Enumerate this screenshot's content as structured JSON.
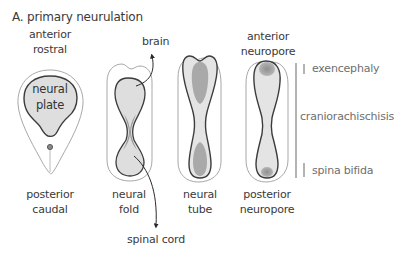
{
  "title": "A. primary neurulation",
  "top_labels": {
    "plate": [
      "anterior",
      "rostral"
    ],
    "pore": [
      "anterior",
      "neuropore"
    ]
  },
  "inner_labels": {
    "plate": [
      "neural",
      "plate"
    ]
  },
  "bottom_labels": {
    "plate": [
      "posterior",
      "caudal"
    ],
    "fold": [
      "neural",
      "fold"
    ],
    "tube": [
      "neural",
      "tube"
    ],
    "pore": [
      "posterior",
      "neuropore"
    ]
  },
  "arrows": {
    "brain": "brain",
    "spinal_cord": "spinal cord"
  },
  "defects": {
    "exencephaly": "exencephaly",
    "craniorachischisis": "craniorachischisis",
    "spina_bifida": "spina bifida"
  },
  "colors": {
    "outline_dark": "#3c3c3c",
    "outline_light": "#a8a8a8",
    "fill_light": "#dedede",
    "fill_dark": "#a9a9a9",
    "text_dark": "#3a3a3a",
    "text_gray": "#6e6e6e"
  }
}
